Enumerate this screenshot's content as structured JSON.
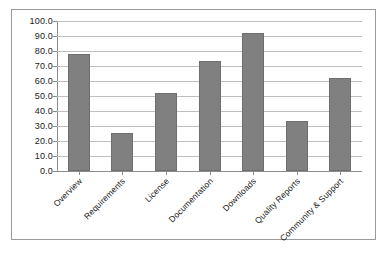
{
  "chart_data": {
    "type": "bar",
    "title": "",
    "subtitle": "",
    "xlabel": "",
    "ylabel": "",
    "categories": [
      "Overview",
      "Requirements",
      "License",
      "Documentation",
      "Downloads",
      "Quality Reports",
      "Community & Support"
    ],
    "values": [
      78.0,
      25.0,
      52.0,
      73.0,
      92.0,
      33.0,
      62.0
    ],
    "ylim": [
      0,
      100
    ],
    "ytick_step": 10,
    "ytick_labels": [
      "100.0",
      "90.0",
      "80.0",
      "70.0",
      "60.0",
      "50.0",
      "40.0",
      "30.0",
      "20.0",
      "10.0",
      "0.0"
    ],
    "grid": true,
    "grid_axis": "y",
    "legend": false,
    "legend_position": "none",
    "series": [
      {
        "name": "",
        "values": [
          78.0,
          25.0,
          52.0,
          73.0,
          92.0,
          33.0,
          62.0
        ]
      }
    ]
  },
  "style": {
    "bar_color": "#808080",
    "bar_border_color": "#6e6e6e",
    "gridline_color": "#bfbfbf",
    "axis_color": "#8c8c8c",
    "frame_color": "#9a9a9a",
    "background": "#ffffff",
    "text_color": "#1a1a1a"
  }
}
